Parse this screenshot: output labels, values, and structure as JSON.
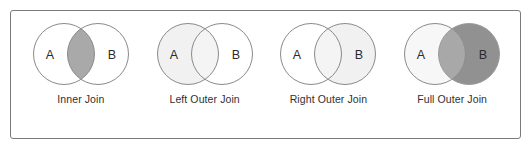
{
  "figure": {
    "background_color": "#ffffff",
    "border_color": "#7b7b7b"
  },
  "palette": {
    "stroke": "#8a8a8a",
    "white": "#ffffff",
    "light_gray": "#f1f1f1",
    "pale_gray": "#f7f7f7",
    "mid_gray": "#a9a9a9",
    "overlap_gray": "#a8a8a8",
    "dark_gray": "#919191",
    "text": "#2f2f2f"
  },
  "diagrams": [
    {
      "label": "Inner Join",
      "left_set": "A",
      "right_set": "B",
      "fill_left_only": "#ffffff",
      "fill_right_only": "#ffffff",
      "fill_overlap": "#a9a9a9",
      "highlight": "intersection"
    },
    {
      "label": "Left Outer Join",
      "left_set": "A",
      "right_set": "B",
      "fill_left_only": "#f1f1f1",
      "fill_right_only": "#ffffff",
      "fill_overlap": "#f4f4f4",
      "highlight": "left-circle"
    },
    {
      "label": "Right Outer Join",
      "left_set": "A",
      "right_set": "B",
      "fill_left_only": "#ffffff",
      "fill_right_only": "#f1f1f1",
      "fill_overlap": "#f4f4f4",
      "highlight": "right-circle"
    },
    {
      "label": "Full Outer Join",
      "left_set": "A",
      "right_set": "B",
      "fill_left_only": "#f7f7f7",
      "fill_right_only": "#919191",
      "fill_overlap": "#a8a8a8",
      "highlight": "both-circles"
    }
  ]
}
